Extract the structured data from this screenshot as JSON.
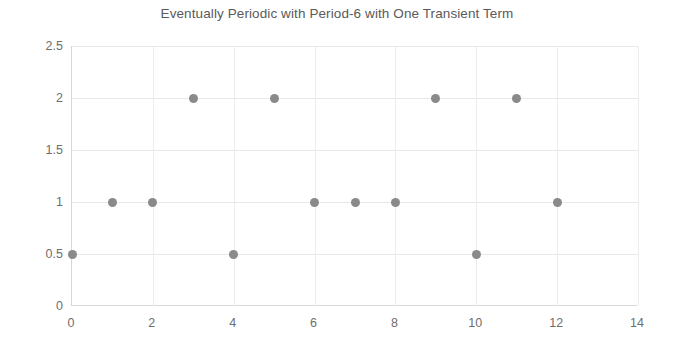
{
  "chart_data": {
    "type": "scatter",
    "title": "Eventually Periodic with Period-6 with One Transient Term",
    "xlabel": "",
    "ylabel": "",
    "xlim": [
      0,
      14
    ],
    "ylim": [
      0,
      2.5
    ],
    "grid": true,
    "legend": false,
    "marker_color": "#8a8a8a",
    "x": [
      0,
      1,
      2,
      3,
      4,
      5,
      6,
      7,
      8,
      9,
      10,
      11,
      12
    ],
    "y": [
      0.5,
      1,
      1,
      2,
      0.5,
      2,
      1,
      1,
      1,
      2,
      0.5,
      2,
      1
    ],
    "points": [
      {
        "x": 0,
        "y": 0.5
      },
      {
        "x": 1,
        "y": 1
      },
      {
        "x": 2,
        "y": 1
      },
      {
        "x": 3,
        "y": 2
      },
      {
        "x": 4,
        "y": 0.5
      },
      {
        "x": 5,
        "y": 2
      },
      {
        "x": 6,
        "y": 1
      },
      {
        "x": 7,
        "y": 1
      },
      {
        "x": 8,
        "y": 1
      },
      {
        "x": 9,
        "y": 2
      },
      {
        "x": 10,
        "y": 0.5
      },
      {
        "x": 11,
        "y": 2
      },
      {
        "x": 12,
        "y": 1
      }
    ],
    "xticks": [
      0,
      2,
      4,
      6,
      8,
      10,
      12,
      14
    ],
    "xtick_labels": [
      "0",
      "2",
      "4",
      "6",
      "8",
      "10",
      "12",
      "14"
    ],
    "yticks": [
      0,
      0.5,
      1,
      1.5,
      2,
      2.5
    ],
    "ytick_labels": [
      "0",
      "0.5",
      "1",
      "1.5",
      "2",
      "2.5"
    ]
  },
  "colors": {
    "background": "#ffffff",
    "title_text": "#5a5a5a",
    "tick_text": "#6e6e6e",
    "gridline": "#e8e8e8",
    "axis_line": "#d8d8d8",
    "marker": "#8a8a8a"
  }
}
